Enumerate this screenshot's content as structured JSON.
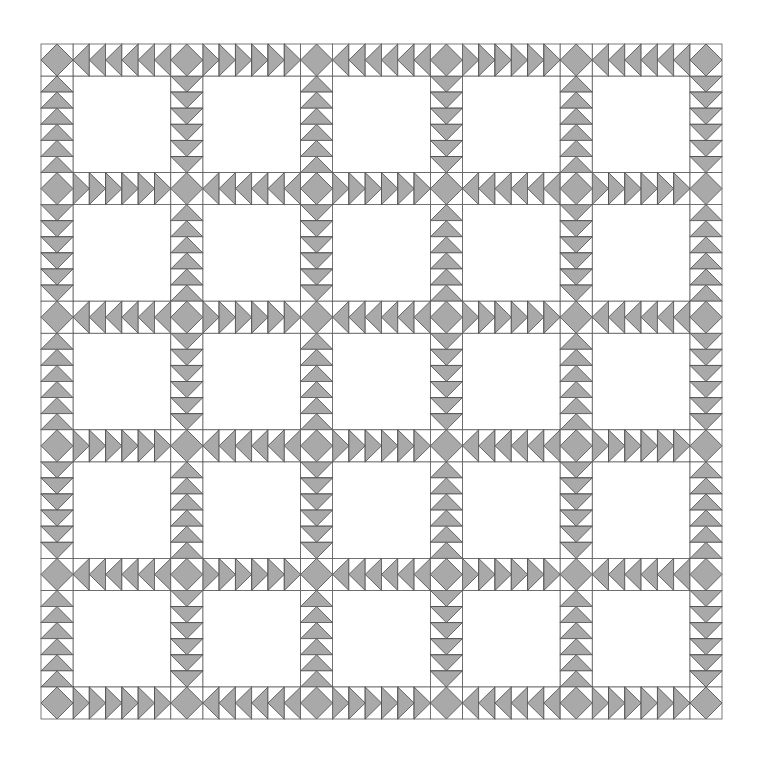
{
  "diagram": {
    "colors": {
      "background": "#ffffff",
      "fill": "#a9a9a9",
      "outline": "#4a4a4a"
    },
    "geometry": {
      "origin_x": 41,
      "origin_y": 44,
      "width": 681,
      "height": 675,
      "sash_width": 32,
      "grid_columns": 6,
      "grid_rows": 6,
      "blocks_across": 5,
      "blocks_down": 5,
      "geese_per_segment": 6
    },
    "cornerstone": "square-on-point diamond",
    "horizontal_sashing_directions": [
      [
        "left",
        "right",
        "left",
        "right",
        "left"
      ],
      [
        "right",
        "left",
        "right",
        "left",
        "right"
      ],
      [
        "left",
        "right",
        "left",
        "right",
        "left"
      ],
      [
        "right",
        "left",
        "right",
        "left",
        "right"
      ],
      [
        "left",
        "right",
        "left",
        "right",
        "left"
      ],
      [
        "right",
        "left",
        "right",
        "left",
        "right"
      ]
    ],
    "vertical_sashing_directions": [
      [
        "up",
        "down",
        "up",
        "down",
        "up"
      ],
      [
        "down",
        "up",
        "down",
        "up",
        "down"
      ],
      [
        "up",
        "down",
        "up",
        "down",
        "up"
      ],
      [
        "down",
        "up",
        "down",
        "up",
        "down"
      ],
      [
        "up",
        "down",
        "up",
        "down",
        "up"
      ],
      [
        "down",
        "up",
        "down",
        "up",
        "down"
      ]
    ]
  }
}
